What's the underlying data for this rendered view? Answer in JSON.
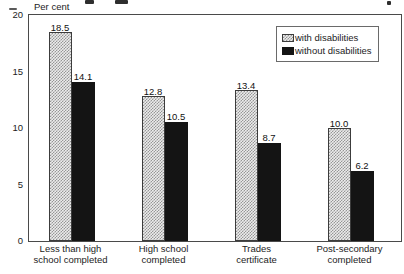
{
  "y_axis_title": "Per cent",
  "legend": {
    "items": [
      {
        "label": "with disabilities",
        "style": "pattern"
      },
      {
        "label": "without disabilities",
        "style": "solid"
      }
    ]
  },
  "chart_data": {
    "type": "bar",
    "title": "",
    "ylabel": "Per cent",
    "xlabel": "",
    "ylim": [
      0,
      20
    ],
    "yticks": [
      20,
      15,
      10,
      5,
      0
    ],
    "grid": false,
    "legend_position": "upper-right",
    "value_labels": true,
    "categories": [
      "Less than high\nschool completed",
      "High school\ncompleted",
      "Trades\ncertificate",
      "Post-secondary\ncompleted"
    ],
    "series": [
      {
        "name": "with disabilities",
        "style": "pattern",
        "values": [
          18.5,
          12.8,
          13.4,
          10.0
        ]
      },
      {
        "name": "without disabilities",
        "style": "solid",
        "values": [
          14.1,
          10.5,
          8.7,
          6.2
        ]
      }
    ]
  },
  "colors": {
    "bar_solid": "#141414",
    "bar_pattern_dark": "#969696",
    "bar_pattern_light": "#ececec",
    "axis_border": "#4a4a4a",
    "text": "#1c1c1c"
  }
}
